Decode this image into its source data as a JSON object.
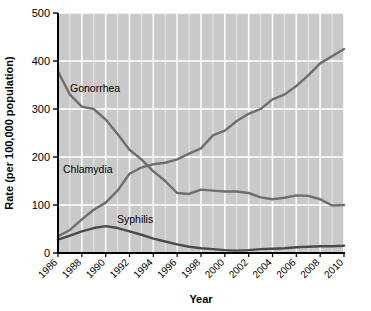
{
  "chart_data": {
    "type": "line",
    "title": "",
    "xlabel": "Year",
    "ylabel": "Rate (per 100,000 population)",
    "xlim": [
      1986,
      2010
    ],
    "ylim": [
      0,
      500
    ],
    "ytick_labels": [
      "0",
      "100",
      "200",
      "300",
      "400",
      "500"
    ],
    "yticks": [
      0,
      100,
      200,
      300,
      400,
      500
    ],
    "xtick_labels": [
      "1986",
      "1988",
      "1990",
      "1992",
      "1994",
      "1996",
      "1998",
      "2000",
      "2002",
      "2004",
      "2006",
      "2008",
      "2010"
    ],
    "xticks": [
      1986,
      1988,
      1990,
      1992,
      1994,
      1996,
      1998,
      2000,
      2002,
      2004,
      2006,
      2008,
      2010
    ],
    "grid": "vertical and horizontal white gridlines on gray panel",
    "legend": "inline series labels on plot",
    "x": [
      1986,
      1987,
      1988,
      1989,
      1990,
      1991,
      1992,
      1993,
      1994,
      1995,
      1996,
      1997,
      1998,
      1999,
      2000,
      2001,
      2002,
      2003,
      2004,
      2005,
      2006,
      2007,
      2008,
      2009,
      2010
    ],
    "series": [
      {
        "name": "Gonorrhea",
        "label": "Gonorrhea",
        "color": "#6e6e6e",
        "values": [
          378,
          330,
          305,
          300,
          278,
          248,
          215,
          195,
          170,
          150,
          125,
          123,
          132,
          130,
          128,
          128,
          125,
          116,
          112,
          115,
          120,
          119,
          112,
          99,
          100
        ]
      },
      {
        "name": "Chlamydia",
        "label": "Chlamydia",
        "color": "#6e6e6e",
        "values": [
          35,
          48,
          70,
          90,
          105,
          130,
          165,
          178,
          185,
          188,
          195,
          207,
          218,
          245,
          255,
          275,
          290,
          300,
          320,
          330,
          348,
          370,
          395,
          410,
          425
        ]
      },
      {
        "name": "Syphilis",
        "label": "Syphilis",
        "color": "#4a4a4a",
        "values": [
          28,
          36,
          45,
          52,
          56,
          52,
          45,
          38,
          30,
          24,
          18,
          13,
          10,
          8,
          6,
          5,
          6,
          8,
          9,
          10,
          12,
          13,
          14,
          14,
          15
        ]
      }
    ],
    "annotations": [
      {
        "name": "gonorrhea-label",
        "text": "Gonorrhea",
        "x_px": 70,
        "y_px": 92
      },
      {
        "name": "chlamydia-label",
        "text": "Chlamydia",
        "x_px": 63,
        "y_px": 173
      },
      {
        "name": "syphilis-label",
        "text": "Syphilis",
        "x_px": 117,
        "y_px": 223
      }
    ],
    "panel_color": "#c9c9c9",
    "gridline_color": "#ffffff",
    "axis_color": "#000000"
  }
}
